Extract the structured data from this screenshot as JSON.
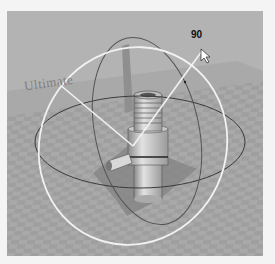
{
  "viewport": {
    "label": "3D viewport",
    "background_color": "#a6a6a6",
    "floor": "checkerboard grid floor",
    "wall_text": "Ultimate"
  },
  "gizmo": {
    "type": "rotate",
    "angle_readout": "90",
    "ring_active_color": "#f2f2f2",
    "ring_inactive_color": "#3a3a3a"
  },
  "model": {
    "name": "pipe fitting",
    "color": "#cfcfcf"
  },
  "cursor": {
    "type": "arrow-pointer"
  }
}
